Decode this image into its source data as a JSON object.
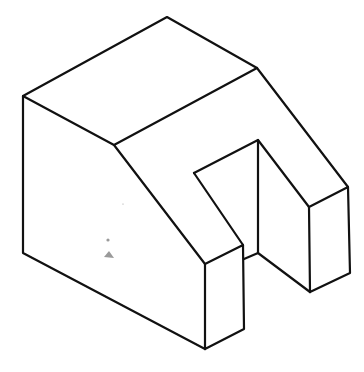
{
  "diagram": {
    "type": "isometric-drawing",
    "stroke_color": "#111111",
    "background": "#ffffff",
    "vertices": {
      "top": [
        167,
        17
      ],
      "left_top": [
        23,
        96
      ],
      "inner_corner": [
        114,
        145
      ],
      "right_top": [
        257,
        68
      ],
      "right_block_top": [
        348,
        187
      ],
      "right_block_front_top": [
        309,
        207
      ],
      "right_block_bottom": [
        310,
        292
      ],
      "right_block_right_bottom": [
        350,
        273
      ],
      "notch_top": [
        258,
        140
      ],
      "notch_left": [
        194,
        173
      ],
      "notch_bottom": [
        258,
        253
      ],
      "notch_joint": [
        244,
        259
      ],
      "left_block_front_top": [
        205,
        264
      ],
      "left_block_right_top": [
        243,
        245
      ],
      "left_block_right_bottom": [
        244,
        329
      ],
      "bottom": [
        205,
        349
      ],
      "left_bottom": [
        23,
        253
      ]
    }
  }
}
